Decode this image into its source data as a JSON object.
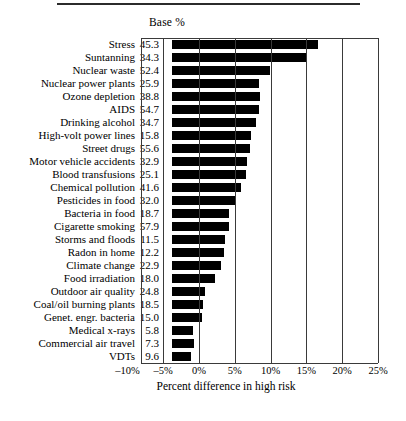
{
  "figure": {
    "base_header": "Base %",
    "axis_title": "Percent difference in high risk"
  },
  "chart_data": {
    "type": "bar",
    "orientation": "horizontal",
    "title": "",
    "xlabel": "Percent difference in high risk",
    "ylabel": "",
    "xlim": [
      -10,
      25
    ],
    "xticks": [
      -10,
      -5,
      0,
      5,
      10,
      15,
      20,
      25
    ],
    "xtick_labels": [
      "–10%",
      "–5%",
      "0%",
      "5%",
      "10%",
      "15%",
      "20%",
      "25%"
    ],
    "grid": true,
    "legend": null,
    "extra_column_header": "Base %",
    "categories": [
      "Stress",
      "Suntanning",
      "Nuclear waste",
      "Nuclear power plants",
      "Ozone depletion",
      "AIDS",
      "Drinking alcohol",
      "High-volt power lines",
      "Street drugs",
      "Motor vehicle accidents",
      "Blood transfusions",
      "Chemical pollution",
      "Pesticides in food",
      "Bacteria in food",
      "Cigarette smoking",
      "Storms and floods",
      "Radon in home",
      "Climate change",
      "Food irradiation",
      "Outdoor air quality",
      "Coal/oil burning plants",
      "Genet. engr. bacteria",
      "Medical x-rays",
      "Commercial air travel",
      "VDTs"
    ],
    "base_percent": [
      "45.3",
      "34.3",
      "52.4",
      "25.9",
      "38.8",
      "54.7",
      "34.7",
      "15.8",
      "55.6",
      "32.9",
      "25.1",
      "41.6",
      "32.0",
      "18.7",
      "57.9",
      "11.5",
      "12.2",
      "22.9",
      "18.0",
      "24.8",
      "18.5",
      "15.0",
      "5.8",
      "7.3",
      "9.6"
    ],
    "values": [
      20.4,
      18.7,
      13.7,
      12.2,
      12.3,
      12.1,
      11.8,
      11.1,
      10.9,
      10.5,
      10.3,
      9.7,
      9.0,
      8.0,
      7.9,
      7.4,
      7.2,
      6.8,
      6.0,
      4.6,
      4.3,
      4.2,
      2.9,
      3.1,
      2.7
    ],
    "rows": [
      {
        "category": "Stress",
        "base": "45.3",
        "value": 20.4
      },
      {
        "category": "Suntanning",
        "base": "34.3",
        "value": 18.7
      },
      {
        "category": "Nuclear waste",
        "base": "52.4",
        "value": 13.7
      },
      {
        "category": "Nuclear power plants",
        "base": "25.9",
        "value": 12.2
      },
      {
        "category": "Ozone depletion",
        "base": "38.8",
        "value": 12.3
      },
      {
        "category": "AIDS",
        "base": "54.7",
        "value": 12.1
      },
      {
        "category": "Drinking alcohol",
        "base": "34.7",
        "value": 11.8
      },
      {
        "category": "High-volt power lines",
        "base": "15.8",
        "value": 11.1
      },
      {
        "category": "Street drugs",
        "base": "55.6",
        "value": 10.9
      },
      {
        "category": "Motor vehicle accidents",
        "base": "32.9",
        "value": 10.5
      },
      {
        "category": "Blood transfusions",
        "base": "25.1",
        "value": 10.3
      },
      {
        "category": "Chemical pollution",
        "base": "41.6",
        "value": 9.7
      },
      {
        "category": "Pesticides in food",
        "base": "32.0",
        "value": 9.0
      },
      {
        "category": "Bacteria in food",
        "base": "18.7",
        "value": 8.0
      },
      {
        "category": "Cigarette smoking",
        "base": "57.9",
        "value": 7.9
      },
      {
        "category": "Storms and floods",
        "base": "11.5",
        "value": 7.4
      },
      {
        "category": "Radon in home",
        "base": "12.2",
        "value": 7.2
      },
      {
        "category": "Climate change",
        "base": "22.9",
        "value": 6.8
      },
      {
        "category": "Food irradiation",
        "base": "18.0",
        "value": 6.0
      },
      {
        "category": "Outdoor air quality",
        "base": "24.8",
        "value": 4.6
      },
      {
        "category": "Coal/oil burning plants",
        "base": "18.5",
        "value": 4.3
      },
      {
        "category": "Genet. engr. bacteria",
        "base": "15.0",
        "value": 4.2
      },
      {
        "category": "Medical x-rays",
        "base": "5.8",
        "value": 2.9
      },
      {
        "category": "Commercial air travel",
        "base": "7.3",
        "value": 3.1
      },
      {
        "category": "VDTs",
        "base": "9.6",
        "value": 2.7
      }
    ],
    "bar_color": "#000000"
  }
}
